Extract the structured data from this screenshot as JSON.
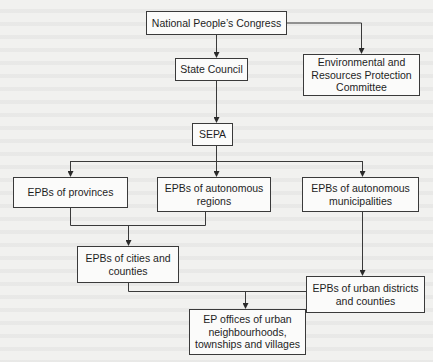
{
  "diagram": {
    "type": "organizational-hierarchy",
    "nodes": [
      {
        "id": "npc",
        "label": "National People’s Congress"
      },
      {
        "id": "eprpc",
        "label": "Environmental and Resources Protection Committee"
      },
      {
        "id": "state_council",
        "label": "State Council"
      },
      {
        "id": "sepa",
        "label": "SEPA"
      },
      {
        "id": "epb_provinces",
        "label": "EPBs of provinces"
      },
      {
        "id": "epb_auto_regions",
        "label": "EPBs of autonomous regions"
      },
      {
        "id": "epb_auto_municipalities",
        "label": "EPBs of autonomous municipalities"
      },
      {
        "id": "epb_cities_counties",
        "label": "EPBs of cities and counties"
      },
      {
        "id": "epb_urban_districts",
        "label": "EPBs of urban districts and counties"
      },
      {
        "id": "ep_offices",
        "label": "EP offices of urban neighbourhoods, townships and villages"
      }
    ],
    "edges": [
      {
        "from": "npc",
        "to": "state_council"
      },
      {
        "from": "npc",
        "to": "eprpc"
      },
      {
        "from": "state_council",
        "to": "sepa"
      },
      {
        "from": "sepa",
        "to": "epb_provinces"
      },
      {
        "from": "sepa",
        "to": "epb_auto_regions"
      },
      {
        "from": "sepa",
        "to": "epb_auto_municipalities"
      },
      {
        "from": "epb_provinces",
        "to": "epb_cities_counties"
      },
      {
        "from": "epb_auto_regions",
        "to": "epb_cities_counties"
      },
      {
        "from": "epb_auto_municipalities",
        "to": "epb_urban_districts"
      },
      {
        "from": "epb_cities_counties",
        "to": "ep_offices"
      },
      {
        "from": "epb_urban_districts",
        "to": "ep_offices"
      }
    ]
  },
  "boxes": {
    "npc": {
      "line1": "National People’s Congress"
    },
    "eprpc": {
      "line1": "Environmental and",
      "line2": "Resources Protection",
      "line3": "Committee"
    },
    "state_council": {
      "line1": "State Council"
    },
    "sepa": {
      "line1": "SEPA"
    },
    "epb_provinces": {
      "line1": "EPBs of provinces"
    },
    "epb_auto_regions": {
      "line1": "EPBs of autonomous",
      "line2": "regions"
    },
    "epb_auto_municipalities": {
      "line1": "EPBs of autonomous",
      "line2": "municipalities"
    },
    "epb_cities_counties": {
      "line1": "EPBs of cities and",
      "line2": "counties"
    },
    "epb_urban_districts": {
      "line1": "EPBs of urban districts",
      "line2": "and counties"
    },
    "ep_offices": {
      "line1": "EP offices of urban",
      "line2": "neighbourhoods,",
      "line3": "townships and villages"
    }
  },
  "colors": {
    "background": "#f1f1ef",
    "line": "#3a3a3a",
    "box_fill": "#fbfbfa",
    "text": "#1e1e1e"
  }
}
